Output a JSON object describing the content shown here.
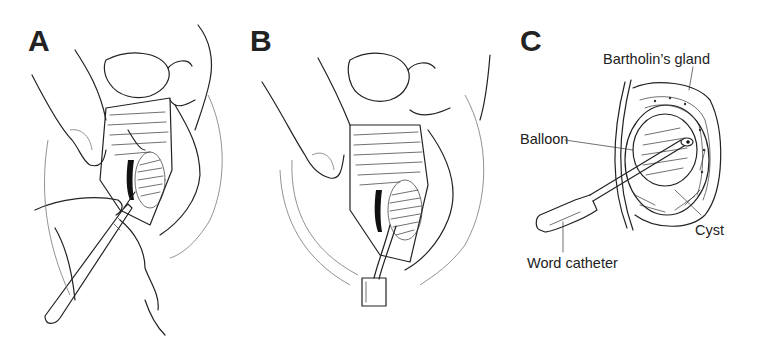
{
  "figure": {
    "panels": [
      {
        "id": "A",
        "letter": "A",
        "description": "Incision into Bartholin's cyst with scalpel while labia are retracted by fingers"
      },
      {
        "id": "B",
        "letter": "B",
        "description": "Word catheter inserted through incision into cyst cavity"
      },
      {
        "id": "C",
        "letter": "C",
        "description": "Cross-section showing inflated balloon of Word catheter within cyst"
      }
    ],
    "labels": {
      "bartholins_gland": "Bartholin’s gland",
      "balloon": "Balloon",
      "cyst": "Cyst",
      "word_catheter": "Word catheter"
    },
    "colors": {
      "line": "#222222",
      "background": "#ffffff"
    }
  }
}
